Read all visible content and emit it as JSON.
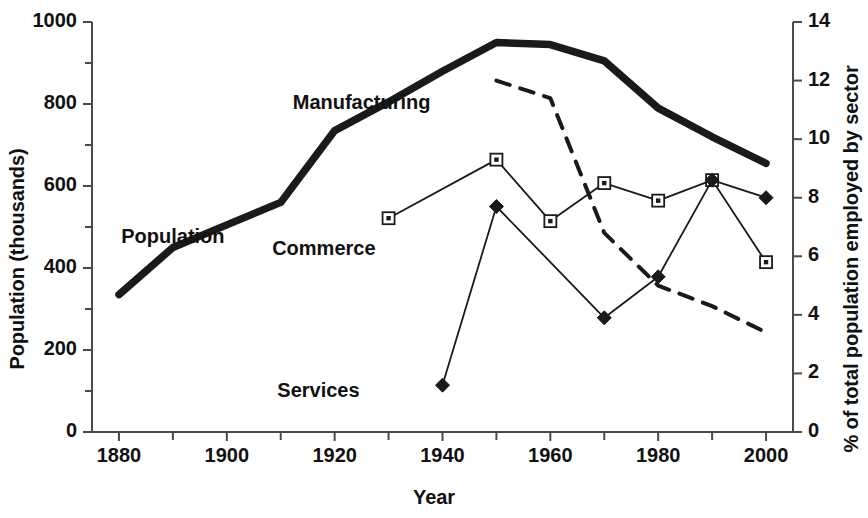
{
  "chart_data": {
    "type": "line",
    "title": "",
    "xlabel": "Year",
    "ylabel": "Population (thousands)",
    "ylabel_right": "% of total population employed by sector",
    "grid": false,
    "legend_position": "inline-annotations",
    "x": [
      1880,
      1890,
      1900,
      1910,
      1920,
      1930,
      1940,
      1950,
      1960,
      1970,
      1980,
      1990,
      2000
    ],
    "xlim": [
      1875,
      2005
    ],
    "xticks": [
      1880,
      1900,
      1920,
      1940,
      1960,
      1980,
      2000
    ],
    "xtick_labels": [
      "1880",
      "1900",
      "1920",
      "1940",
      "1960",
      "1980",
      "2000"
    ],
    "xminor_ticks": [
      1890,
      1910,
      1930,
      1950,
      1970,
      1990
    ],
    "ylim_left": [
      0,
      1000
    ],
    "yticks_left": [
      0,
      200,
      400,
      600,
      800,
      1000
    ],
    "ytick_labels_left": [
      "0",
      "200",
      "400",
      "600",
      "800",
      "1000"
    ],
    "yminor_ticks_left": [
      100,
      300,
      500,
      700,
      900
    ],
    "ylim_right": [
      0,
      14
    ],
    "yticks_right": [
      0,
      2,
      4,
      6,
      8,
      10,
      12,
      14
    ],
    "ytick_labels_right": [
      "0",
      "2",
      "4",
      "6",
      "8",
      "10",
      "12",
      "14"
    ],
    "series": [
      {
        "name": "Population",
        "axis": "left",
        "style": "thick-solid",
        "marker": "none",
        "color": "#1a1a1a",
        "x": [
          1880,
          1890,
          1900,
          1910,
          1920,
          1930,
          1940,
          1950,
          1960,
          1970,
          1980,
          1990,
          2000
        ],
        "values": [
          335,
          450,
          505,
          560,
          735,
          805,
          880,
          950,
          945,
          905,
          790,
          720,
          655
        ]
      },
      {
        "name": "Manufacturing",
        "axis": "right",
        "style": "dashed",
        "marker": "none",
        "color": "#1a1a1a",
        "x": [
          1950,
          1960,
          1970,
          1980,
          1990,
          2000
        ],
        "values": [
          12.0,
          11.4,
          6.8,
          5.0,
          4.3,
          3.4
        ]
      },
      {
        "name": "Commerce",
        "axis": "right",
        "style": "thin-solid",
        "marker": "open-square",
        "color": "#1a1a1a",
        "x": [
          1930,
          1950,
          1960,
          1970,
          1980,
          1990,
          2000
        ],
        "values": [
          7.3,
          9.3,
          7.2,
          8.5,
          7.9,
          8.6,
          5.8
        ]
      },
      {
        "name": "Services",
        "axis": "right",
        "style": "thin-solid",
        "marker": "filled-diamond",
        "color": "#1a1a1a",
        "x": [
          1940,
          1950,
          1970,
          1980,
          1990,
          2000
        ],
        "values": [
          1.6,
          7.7,
          3.9,
          5.3,
          8.6,
          8.0
        ]
      }
    ],
    "annotations": [
      {
        "text": "Population",
        "x": 1890,
        "y_px": 236
      },
      {
        "text": "Manufacturing",
        "x": 1925,
        "y_px": 102
      },
      {
        "text": "Commerce",
        "x": 1918,
        "y_px": 248
      },
      {
        "text": "Services",
        "x": 1917,
        "y_px": 390
      }
    ]
  },
  "colors": {
    "ink": "#1a1a1a",
    "axis": "#4a4a4a",
    "background": "#ffffff"
  }
}
